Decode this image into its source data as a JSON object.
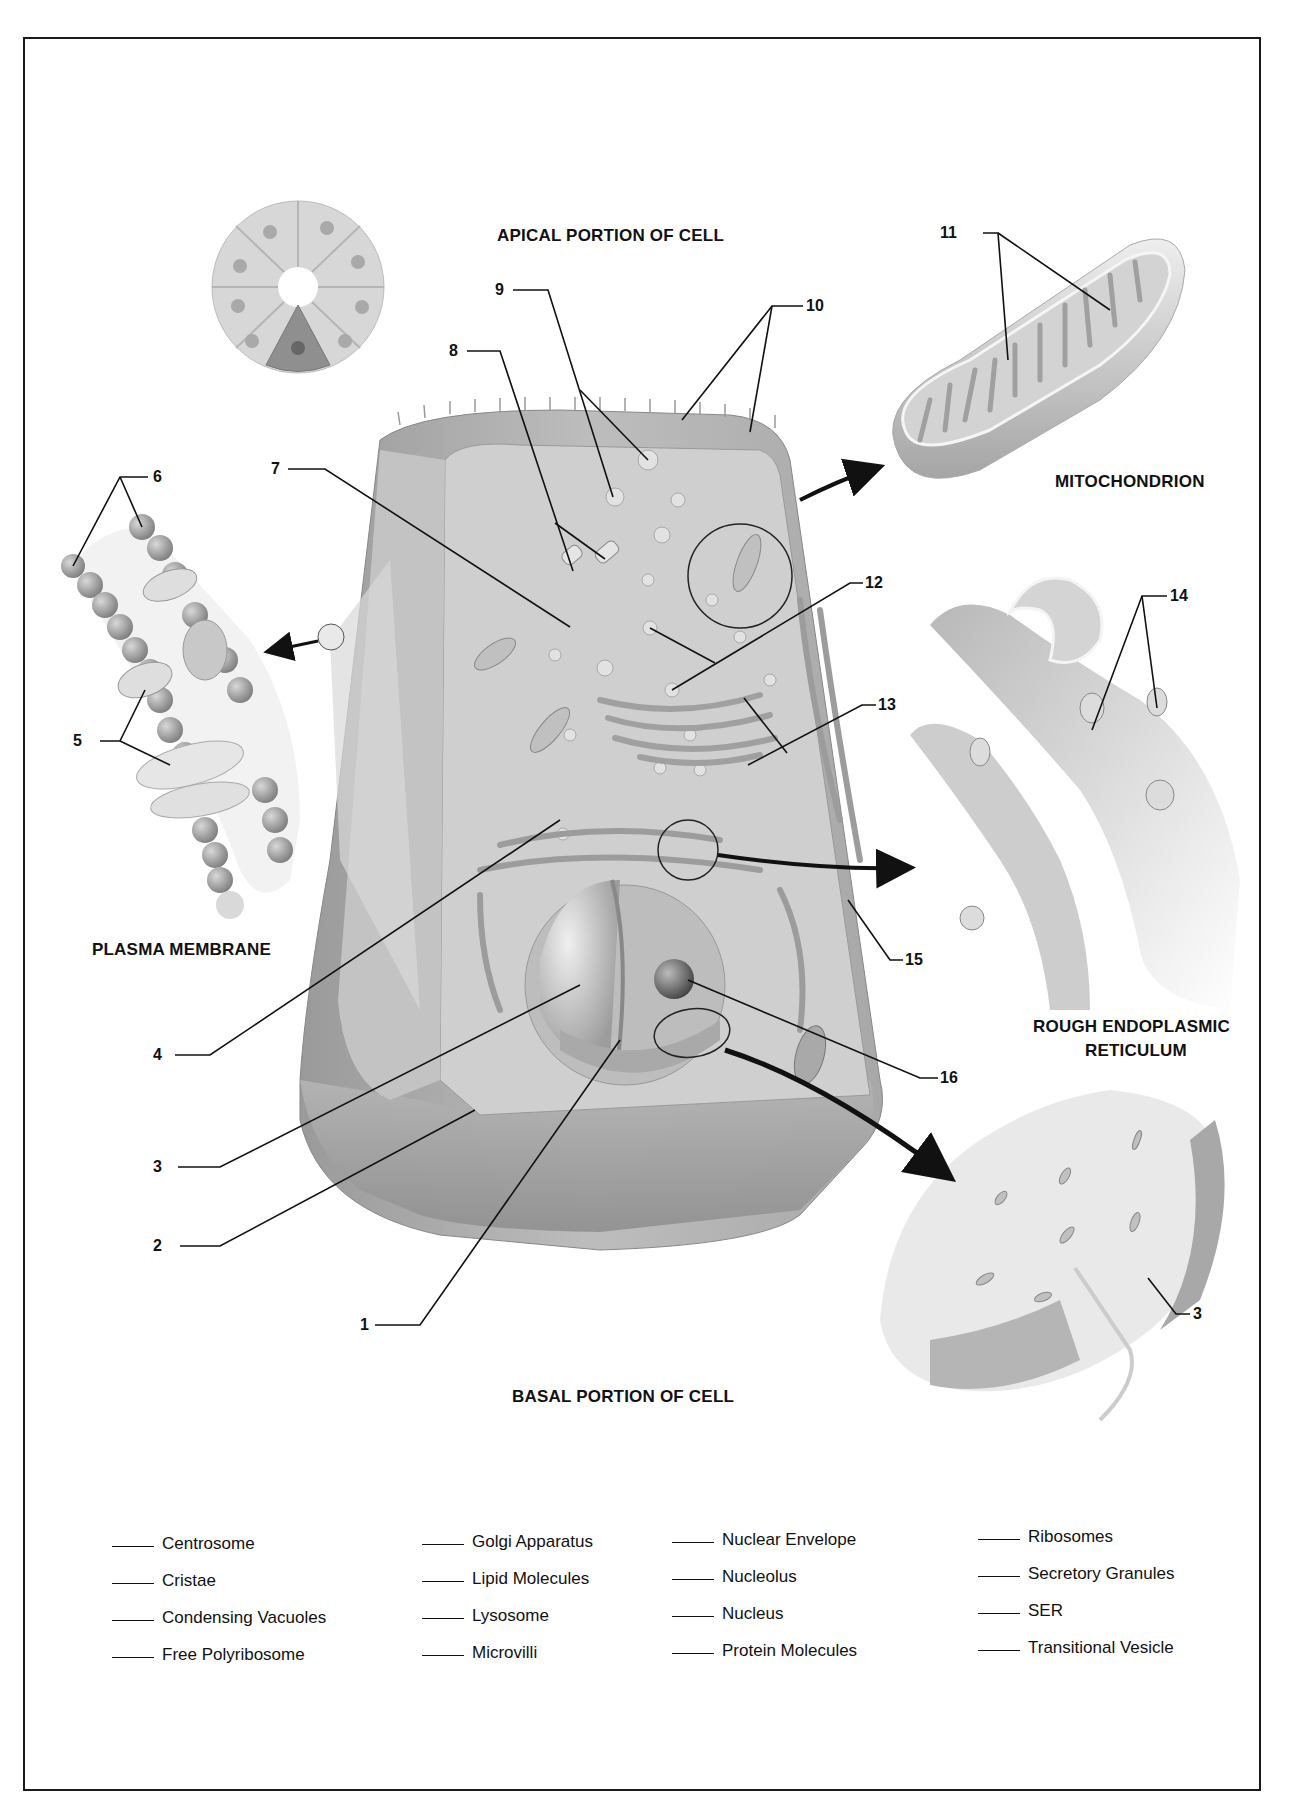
{
  "diagram": {
    "section_titles": {
      "apical": "APICAL PORTION OF CELL",
      "basal": "BASAL PORTION OF CELL"
    },
    "inset_titles": {
      "mitochondrion": "MITOCHONDRION",
      "plasma_membrane": "PLASMA MEMBRANE",
      "rer_line1": "ROUGH ENDOPLASMIC",
      "rer_line2": "RETICULUM"
    },
    "callouts": {
      "n1": "1",
      "n2": "2",
      "n3": "3",
      "n3b": "3",
      "n4": "4",
      "n5": "5",
      "n6": "6",
      "n7": "7",
      "n8": "8",
      "n9": "9",
      "n10": "10",
      "n11": "11",
      "n12": "12",
      "n13": "13",
      "n14": "14",
      "n15": "15",
      "n16": "16"
    },
    "colors": {
      "cell_fill": "#b9b9b9",
      "cytoplasm": "#cfcfcf",
      "outline": "#1a1a1a",
      "inset_fill": "#e2e2e2"
    }
  },
  "word_bank": {
    "columns": [
      [
        "Centrosome",
        "Cristae",
        "Condensing Vacuoles",
        "Free Polyribosome"
      ],
      [
        "Golgi Apparatus",
        "Lipid Molecules",
        "Lysosome",
        "Microvilli"
      ],
      [
        "Nuclear Envelope",
        "Nucleolus",
        "Nucleus",
        "Protein Molecules"
      ],
      [
        "Ribosomes",
        "Secretory Granules",
        "SER",
        "Transitional Vesicle"
      ]
    ]
  }
}
